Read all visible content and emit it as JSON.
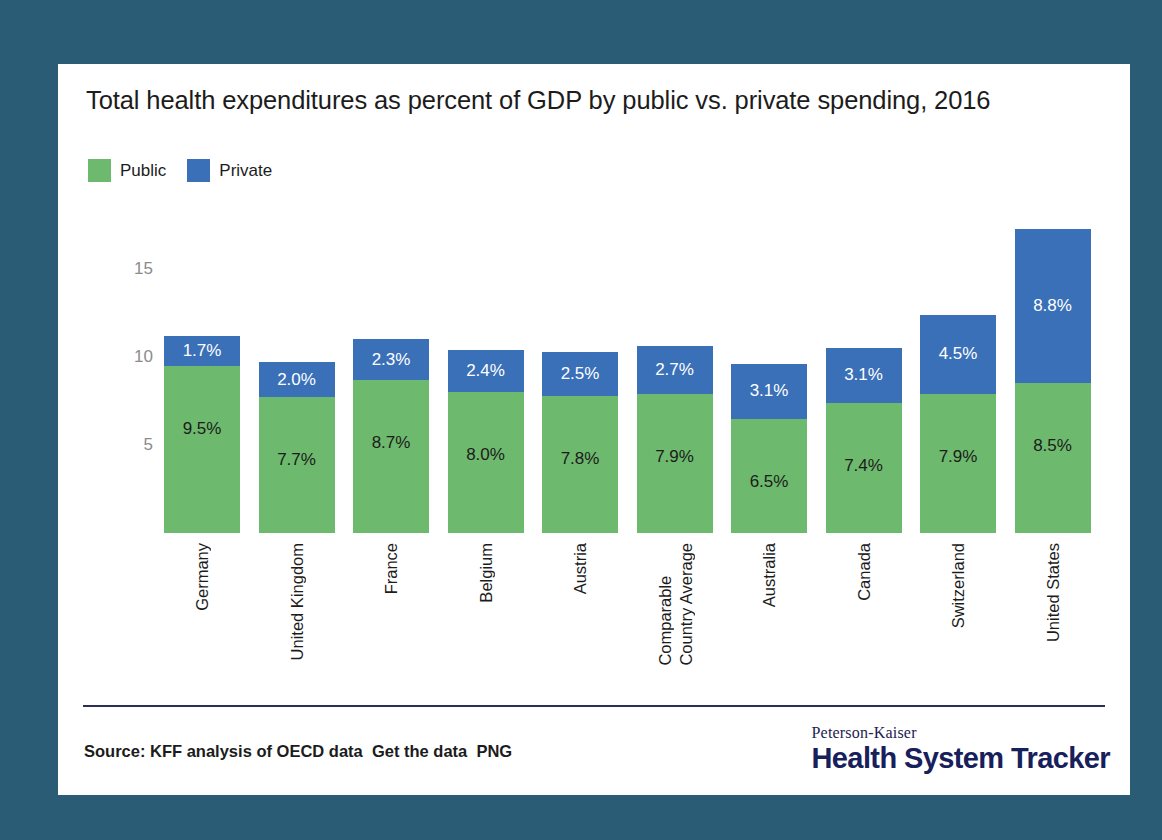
{
  "page": {
    "background_color": "#2b5c76",
    "card_background": "#ffffff"
  },
  "title": "Total health expenditures as percent of GDP by public vs. private spending, 2016",
  "legend": {
    "items": [
      {
        "label": "Public",
        "color": "#6db96d"
      },
      {
        "label": "Private",
        "color": "#3a70b8"
      }
    ]
  },
  "footer": {
    "source": "Source: KFF analysis of OECD data  Get the data  PNG",
    "brand_top": "Peterson-Kaiser",
    "brand_main": "Health System Tracker",
    "rule_color": "#2b2f52"
  },
  "chart_data": {
    "type": "bar",
    "subtype": "stacked-vertical",
    "title": "Total health expenditures as percent of GDP by public vs. private spending, 2016",
    "xlabel": "",
    "ylabel": "",
    "ylim": [
      0,
      18
    ],
    "yticks": [
      5,
      10,
      15
    ],
    "ytick_labels": [
      "5",
      "10",
      "15"
    ],
    "grid": false,
    "legend_position": "top-left",
    "categories": [
      "Germany",
      "United Kingdom",
      "France",
      "Belgium",
      "Austria",
      "Comparable Country Average",
      "Australia",
      "Canada",
      "Switzerland",
      "United States"
    ],
    "category_lines": [
      [
        "Germany"
      ],
      [
        "United Kingdom"
      ],
      [
        "France"
      ],
      [
        "Belgium"
      ],
      [
        "Austria"
      ],
      [
        "Comparable",
        "Country Average"
      ],
      [
        "Australia"
      ],
      [
        "Canada"
      ],
      [
        "Switzerland"
      ],
      [
        "United States"
      ]
    ],
    "series": [
      {
        "name": "Public",
        "color": "#6db96d",
        "values": [
          9.5,
          7.7,
          8.7,
          8.0,
          7.8,
          7.9,
          6.5,
          7.4,
          7.9,
          8.5
        ],
        "labels": [
          "9.5%",
          "7.7%",
          "8.7%",
          "8.0%",
          "7.8%",
          "7.9%",
          "6.5%",
          "7.4%",
          "7.9%",
          "8.5%"
        ]
      },
      {
        "name": "Private",
        "color": "#3a70b8",
        "values": [
          1.7,
          2.0,
          2.3,
          2.4,
          2.5,
          2.7,
          3.1,
          3.1,
          4.5,
          8.8
        ],
        "labels": [
          "1.7%",
          "2.0%",
          "2.3%",
          "2.4%",
          "2.5%",
          "2.7%",
          "3.1%",
          "3.1%",
          "4.5%",
          "8.8%"
        ]
      }
    ],
    "totals": [
      11.2,
      9.7,
      11.0,
      10.4,
      10.3,
      10.6,
      9.6,
      10.5,
      12.4,
      17.3
    ]
  }
}
